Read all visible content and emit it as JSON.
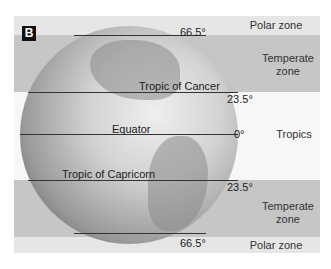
{
  "badge": "B",
  "lines": {
    "n665": "66.5°",
    "cancer_label": "Tropic of Cancer",
    "n235": "23.5°",
    "equator_label": "Equator",
    "eq": "0°",
    "capricorn_label": "Tropic of Capricorn",
    "s235": "23.5°",
    "s665": "66.5°"
  },
  "zones": {
    "polar_top": "Polar zone",
    "temperate_top_1": "Temperate",
    "temperate_top_2": "zone",
    "tropics": "Tropics",
    "temperate_bottom_1": "Temperate",
    "temperate_bottom_2": "zone",
    "polar_bottom": "Polar zone"
  }
}
